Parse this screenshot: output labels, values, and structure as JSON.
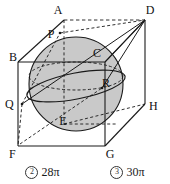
{
  "figure": {
    "type": "cube-with-inscribed-sphere",
    "fill_color": "#c9c9c9",
    "line_color": "#1a1a1a",
    "vertices": [
      {
        "id": "A",
        "label": "A",
        "x": 58,
        "y": 9
      },
      {
        "id": "D",
        "label": "D",
        "x": 150,
        "y": 9
      },
      {
        "id": "B",
        "label": "B",
        "x": 11,
        "y": 57
      },
      {
        "id": "C",
        "label": "C",
        "x": 100,
        "y": 52
      },
      {
        "id": "H",
        "label": "H",
        "x": 150,
        "y": 105
      },
      {
        "id": "E",
        "label": "E",
        "x": 63,
        "y": 120
      },
      {
        "id": "F",
        "label": "F",
        "x": 11,
        "y": 151
      },
      {
        "id": "G",
        "label": "G",
        "x": 112,
        "y": 151
      }
    ],
    "points": [
      {
        "id": "P",
        "label": "P",
        "x": 51,
        "y": 35
      },
      {
        "id": "Q",
        "label": "Q",
        "x": 9,
        "y": 100
      },
      {
        "id": "R",
        "label": "R",
        "x": 106,
        "y": 83
      }
    ],
    "sphere": {
      "cx": 76,
      "cy": 84,
      "r": 47
    }
  },
  "options": [
    {
      "number": "2",
      "marker": "②",
      "text": "28π"
    },
    {
      "number": "3",
      "marker": "③",
      "text": "30π"
    }
  ]
}
